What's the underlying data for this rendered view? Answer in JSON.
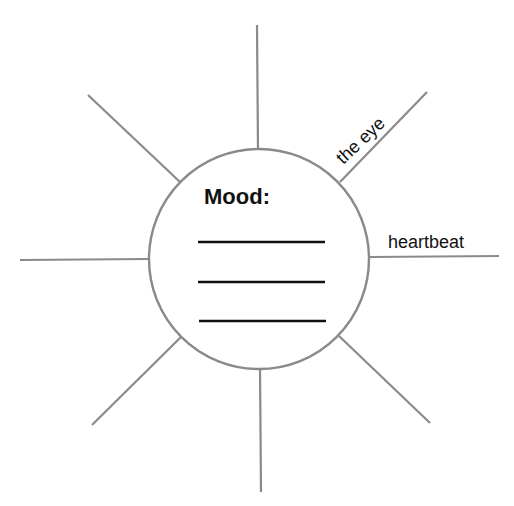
{
  "diagram": {
    "type": "spider-web organizer",
    "hub": {
      "title": "Mood:",
      "blank_lines": 3
    },
    "spokes": [
      {
        "position": "top",
        "label": ""
      },
      {
        "position": "upper-right",
        "label": "the eye"
      },
      {
        "position": "right",
        "label": "heartbeat"
      },
      {
        "position": "lower-right",
        "label": ""
      },
      {
        "position": "bottom",
        "label": ""
      },
      {
        "position": "lower-left",
        "label": ""
      },
      {
        "position": "left",
        "label": ""
      },
      {
        "position": "upper-left",
        "label": ""
      }
    ],
    "colors": {
      "spoke": "#8a8a8a",
      "text": "#111111",
      "background": "#ffffff"
    }
  }
}
